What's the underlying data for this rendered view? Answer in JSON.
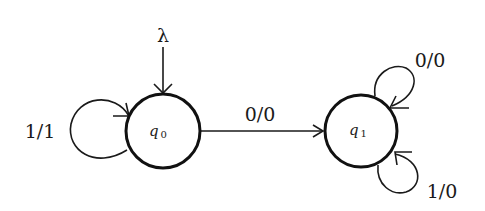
{
  "diagram": {
    "type": "finite-state-transducer",
    "start_symbol": "λ",
    "states": [
      {
        "id": "q0",
        "label": "q",
        "subscript": "0",
        "initial": true
      },
      {
        "id": "q1",
        "label": "q",
        "subscript": "1",
        "initial": false
      }
    ],
    "transitions": [
      {
        "from": "q0",
        "to": "q0",
        "label": "1/1"
      },
      {
        "from": "q0",
        "to": "q1",
        "label": "0/0"
      },
      {
        "from": "q1",
        "to": "q1",
        "label": "0/0",
        "position": "top-right"
      },
      {
        "from": "q1",
        "to": "q1",
        "label": "1/0",
        "position": "bottom-right"
      }
    ],
    "colors": {
      "background": "#ffffff",
      "stroke": "#111111"
    }
  }
}
